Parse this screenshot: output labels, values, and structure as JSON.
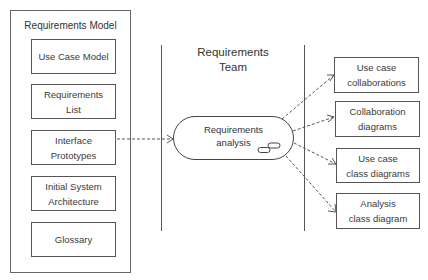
{
  "requirements_model": {
    "title": "Requirements Model",
    "artifacts": [
      {
        "label": "Use Case Model"
      },
      {
        "label": "Requirements\nList"
      },
      {
        "label": "Interface\nPrototypes"
      },
      {
        "label": "Initial System\nArchitecture"
      },
      {
        "label": "Glossary"
      }
    ]
  },
  "swimlane": {
    "title": "Requirements\nTeam"
  },
  "activity": {
    "label": "Requirements\nanalysis",
    "icon": "activity-icon"
  },
  "outputs": [
    {
      "label": "Use case\ncollaborations"
    },
    {
      "label": "Collaboration\ndiagrams"
    },
    {
      "label": "Use case\nclass diagrams"
    },
    {
      "label": "Analysis\nclass diagram"
    }
  ]
}
